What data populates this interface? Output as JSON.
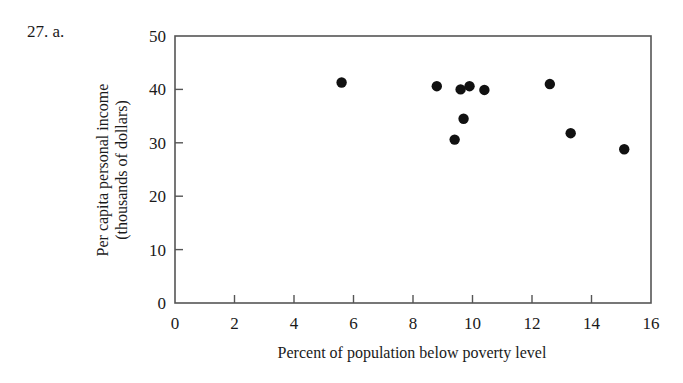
{
  "problem": {
    "label": "27. a."
  },
  "chart_data": {
    "type": "scatter",
    "title": "",
    "xlabel": "Percent of population below poverty level",
    "ylabel_line1": "Per capita personal income",
    "ylabel_line2": "(thousands of dollars)",
    "xlim": [
      0,
      16
    ],
    "ylim": [
      0,
      50
    ],
    "xticks": [
      0,
      2,
      4,
      6,
      8,
      10,
      12,
      14,
      16
    ],
    "yticks": [
      0,
      10,
      20,
      30,
      40,
      50
    ],
    "grid": false,
    "legend": null,
    "marker_color": "#111111",
    "points": [
      {
        "x": 5.6,
        "y": 41.3
      },
      {
        "x": 8.8,
        "y": 40.6
      },
      {
        "x": 9.6,
        "y": 40.0
      },
      {
        "x": 9.9,
        "y": 40.6
      },
      {
        "x": 10.4,
        "y": 39.9
      },
      {
        "x": 9.7,
        "y": 34.5
      },
      {
        "x": 9.4,
        "y": 30.6
      },
      {
        "x": 12.6,
        "y": 41.0
      },
      {
        "x": 13.3,
        "y": 31.8
      },
      {
        "x": 15.1,
        "y": 28.8
      }
    ]
  }
}
